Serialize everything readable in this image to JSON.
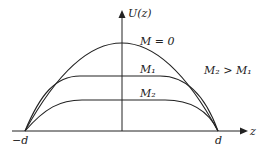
{
  "diagram": {
    "y_axis_label": "U(z)",
    "x_axis_label": "z",
    "left_tick": "−d",
    "right_tick": "d",
    "curves": [
      {
        "label": "M = 0",
        "shape": "parabola"
      },
      {
        "label": "M₁",
        "shape": "flattened plateau"
      },
      {
        "label": "M₂",
        "shape": "flattened plateau (lower)"
      }
    ],
    "relation": "M₂ > M₁",
    "line_color": "#222222"
  }
}
